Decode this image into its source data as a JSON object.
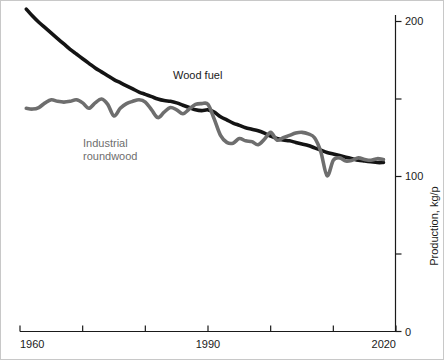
{
  "chart_data": {
    "type": "line",
    "title": "",
    "subtitle": "",
    "xlabel": "",
    "ylabel": "Production, kg/p",
    "xlim": [
      1960,
      2020
    ],
    "ylim": [
      0,
      215
    ],
    "grid": false,
    "legend_position": "inline-annotation",
    "x_ticks": [
      1960,
      1970,
      1980,
      1990,
      2000,
      2010,
      2020
    ],
    "x_tick_labels": [
      "1960",
      "",
      "",
      "1990",
      "",
      "",
      "2020"
    ],
    "y_ticks": [
      0,
      50,
      100,
      150,
      200
    ],
    "y_tick_labels": [
      "0",
      "",
      "100",
      "",
      "200"
    ],
    "y_axis_side": "right",
    "annotations": [
      {
        "text": "Wood fuel",
        "x": 1990,
        "y": 158,
        "color": "#1a1a1a"
      },
      {
        "text": "Industrial",
        "x": 1976,
        "y": 118,
        "color": "#6e6e6e"
      },
      {
        "text": "roundwood",
        "x": 1976,
        "y": 110,
        "color": "#6e6e6e"
      }
    ],
    "x": [
      1961,
      1962,
      1963,
      1964,
      1965,
      1966,
      1967,
      1968,
      1969,
      1970,
      1971,
      1972,
      1973,
      1974,
      1975,
      1976,
      1977,
      1978,
      1979,
      1980,
      1981,
      1982,
      1983,
      1984,
      1985,
      1986,
      1987,
      1988,
      1989,
      1990,
      1991,
      1992,
      1993,
      1994,
      1995,
      1996,
      1997,
      1998,
      1999,
      2000,
      2001,
      2002,
      2003,
      2004,
      2005,
      2006,
      2007,
      2008,
      2009,
      2010,
      2011,
      2012,
      2013,
      2014,
      2015,
      2016,
      2017,
      2018
    ],
    "series": [
      {
        "name": "Wood fuel",
        "color": "#141414",
        "linewidth": 3.6,
        "values": [
          208.0,
          203.5,
          199.5,
          196.0,
          192.5,
          189.0,
          185.5,
          182.0,
          179.0,
          176.0,
          173.0,
          170.0,
          167.5,
          165.0,
          162.5,
          160.5,
          158.5,
          156.5,
          154.5,
          153.0,
          151.5,
          150.0,
          149.0,
          148.5,
          147.5,
          146.0,
          144.5,
          143.0,
          142.5,
          143.0,
          141.5,
          138.5,
          136.5,
          134.5,
          133.0,
          131.5,
          130.5,
          129.5,
          128.0,
          126.0,
          124.5,
          123.5,
          123.0,
          122.0,
          121.0,
          120.0,
          118.5,
          117.0,
          115.5,
          114.5,
          113.5,
          112.5,
          111.5,
          110.5,
          110.0,
          109.5,
          109.0,
          109.0
        ]
      },
      {
        "name": "Industrial roundwood",
        "color": "#6e6e6e",
        "linewidth": 3.6,
        "values": [
          144.0,
          143.5,
          144.5,
          147.5,
          149.5,
          148.5,
          148.0,
          148.5,
          149.5,
          147.5,
          144.0,
          147.5,
          150.0,
          146.5,
          139.0,
          144.0,
          147.0,
          148.5,
          149.5,
          148.0,
          143.0,
          138.0,
          141.5,
          144.5,
          143.0,
          140.5,
          143.5,
          146.5,
          147.0,
          146.5,
          137.0,
          126.5,
          122.0,
          121.5,
          124.5,
          123.0,
          122.5,
          120.5,
          124.0,
          128.5,
          123.5,
          125.0,
          126.5,
          128.0,
          128.5,
          127.5,
          125.0,
          116.0,
          100.5,
          110.5,
          112.0,
          110.0,
          110.5,
          112.0,
          111.0,
          110.5,
          111.5,
          111.0
        ]
      }
    ]
  },
  "axes": {
    "y_axis_title": "Production, kg/p",
    "x_first_label": "1960",
    "x_mid_label": "1990",
    "x_last_label": "2020",
    "y_label_200": "200",
    "y_label_100": "100",
    "y_label_0": "0"
  },
  "labels": {
    "wood_fuel": "Wood fuel",
    "industrial_line1": "Industrial",
    "industrial_line2": "roundwood"
  },
  "colors": {
    "wood_fuel": "#141414",
    "industrial_roundwood": "#6e6e6e",
    "axis": "#1a1a1a",
    "background": "#ffffff",
    "border": "#c8c8c8"
  }
}
